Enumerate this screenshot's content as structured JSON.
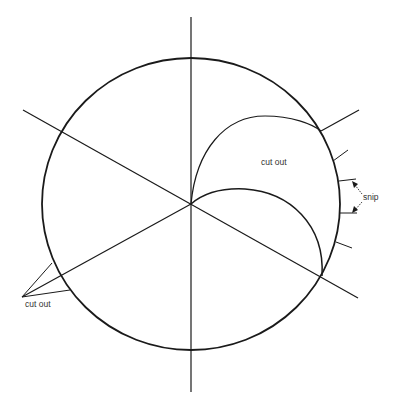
{
  "diagram": {
    "colors": {
      "stroke": "#1a1a1a",
      "text": "#333333",
      "background": "#ffffff"
    },
    "labels": {
      "cut_out_inner": "cut out",
      "snip": "snip",
      "cut_out_outer": "cut out"
    },
    "elements": {
      "circle": {
        "cx": 191,
        "cy": 204,
        "rx": 149,
        "ry": 146
      },
      "vertical_line": {
        "x": 191,
        "y1": 17,
        "y2": 392
      },
      "diagonal_1": {
        "from": [
          23,
          110
        ],
        "to": [
          358,
          298
        ]
      },
      "diagonal_2": {
        "from": [
          22,
          297
        ],
        "to": [
          359,
          110
        ]
      },
      "snip_ticks": 4
    }
  }
}
